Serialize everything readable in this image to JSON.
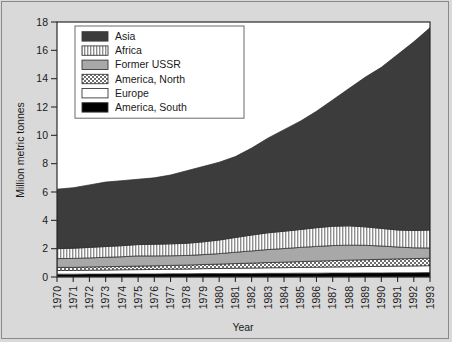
{
  "figure": {
    "background_color": "#d9d9d9",
    "plot_background_color": "#ffffff",
    "border_color": "#8a8a8a"
  },
  "chart_data": {
    "type": "area",
    "stacked": true,
    "title": "",
    "xlabel": "Year",
    "ylabel": "Million metric tonnes",
    "xlim": [
      1970,
      1993
    ],
    "ylim": [
      0,
      18
    ],
    "ytick_values": [
      0,
      2,
      4,
      6,
      8,
      10,
      12,
      14,
      16,
      18
    ],
    "ytick_labels": [
      "0",
      "2",
      "4",
      "6",
      "8",
      "10",
      "12",
      "14",
      "16",
      "18"
    ],
    "grid": false,
    "legend_position": "upper-left-inside",
    "x": [
      1970,
      1971,
      1972,
      1973,
      1974,
      1975,
      1976,
      1977,
      1978,
      1979,
      1980,
      1981,
      1982,
      1983,
      1984,
      1985,
      1986,
      1987,
      1988,
      1989,
      1990,
      1991,
      1992,
      1993
    ],
    "xtick_labels": [
      "1970",
      "1971",
      "1972",
      "1973",
      "1974",
      "1975",
      "1976",
      "1977",
      "1978",
      "1979",
      "1980",
      "1981",
      "1982",
      "1983",
      "1984",
      "1985",
      "1986",
      "1987",
      "1988",
      "1989",
      "1990",
      "1991",
      "1992",
      "1993"
    ],
    "stack_order_bottom_to_top": [
      "America, South",
      "Europe",
      "America, North",
      "Former USSR",
      "Africa",
      "Asia"
    ],
    "series": [
      {
        "name": "America, South",
        "fill": "#000000",
        "pattern": "solid-black",
        "values": [
          0.2,
          0.2,
          0.21,
          0.21,
          0.22,
          0.22,
          0.22,
          0.23,
          0.23,
          0.24,
          0.24,
          0.25,
          0.25,
          0.26,
          0.26,
          0.27,
          0.27,
          0.28,
          0.28,
          0.29,
          0.29,
          0.3,
          0.3,
          0.31
        ]
      },
      {
        "name": "Europe",
        "fill": "#ffffff",
        "pattern": "solid-white",
        "values": [
          0.26,
          0.26,
          0.27,
          0.28,
          0.29,
          0.3,
          0.31,
          0.32,
          0.33,
          0.35,
          0.36,
          0.37,
          0.38,
          0.39,
          0.4,
          0.41,
          0.42,
          0.43,
          0.44,
          0.45,
          0.46,
          0.47,
          0.48,
          0.49
        ]
      },
      {
        "name": "America, North",
        "fill": "#b4b4b4",
        "pattern": "checker",
        "values": [
          0.22,
          0.22,
          0.23,
          0.24,
          0.24,
          0.25,
          0.26,
          0.27,
          0.28,
          0.29,
          0.31,
          0.33,
          0.35,
          0.37,
          0.39,
          0.41,
          0.43,
          0.45,
          0.47,
          0.48,
          0.5,
          0.51,
          0.52,
          0.53
        ]
      },
      {
        "name": "Former USSR",
        "fill": "#a8a8a8",
        "pattern": "solid-gray",
        "values": [
          0.62,
          0.63,
          0.64,
          0.66,
          0.68,
          0.72,
          0.7,
          0.68,
          0.68,
          0.7,
          0.74,
          0.8,
          0.86,
          0.92,
          0.96,
          1.0,
          1.04,
          1.06,
          1.06,
          1.02,
          0.94,
          0.84,
          0.76,
          0.72
        ]
      },
      {
        "name": "Africa",
        "fill": "#e8e8e8",
        "pattern": "vertical-lines",
        "values": [
          0.7,
          0.72,
          0.74,
          0.76,
          0.78,
          0.8,
          0.82,
          0.84,
          0.86,
          0.9,
          0.96,
          1.04,
          1.12,
          1.18,
          1.22,
          1.26,
          1.32,
          1.36,
          1.36,
          1.3,
          1.24,
          1.2,
          1.22,
          1.26
        ]
      },
      {
        "name": "Asia",
        "fill": "#3c3c3c",
        "pattern": "solid-dark",
        "values": [
          4.2,
          4.27,
          4.41,
          4.55,
          4.59,
          4.61,
          4.69,
          4.86,
          5.12,
          5.32,
          5.49,
          5.71,
          6.14,
          6.68,
          7.17,
          7.65,
          8.22,
          8.92,
          9.69,
          10.56,
          11.37,
          12.38,
          13.32,
          14.29
        ]
      }
    ],
    "legend_entries": [
      {
        "label": "Asia",
        "swatch": "solid-dark"
      },
      {
        "label": "Africa",
        "swatch": "vertical-lines"
      },
      {
        "label": "Former USSR",
        "swatch": "solid-gray"
      },
      {
        "label": "America, North",
        "swatch": "checker"
      },
      {
        "label": "Europe",
        "swatch": "solid-white"
      },
      {
        "label": "America, South",
        "swatch": "solid-black"
      }
    ]
  }
}
